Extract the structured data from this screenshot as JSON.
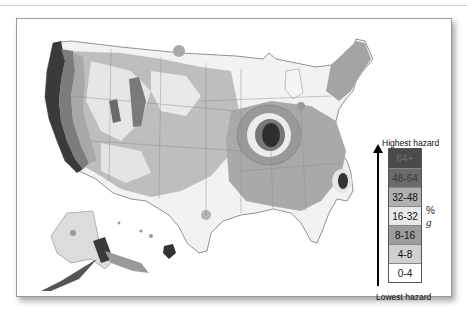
{
  "map": {
    "title": "Seismic hazard map of the United States",
    "regions_shown": [
      "Contiguous United States",
      "Alaska",
      "Hawaii"
    ]
  },
  "legend": {
    "top_label": "Highest hazard",
    "bottom_label": "Lowest hazard",
    "unit_prefix": "%",
    "unit_symbol": "g",
    "bins": [
      {
        "label": "64+",
        "color": "#4a4a4a",
        "text_color": "#6a6a6a"
      },
      {
        "label": "48-64",
        "color": "#6b6b6b",
        "text_color": "#3a3a3a"
      },
      {
        "label": "32-48",
        "color": "#b0b0b0",
        "text_color": "#111111"
      },
      {
        "label": "16-32",
        "color": "#e8e8e8",
        "text_color": "#111111"
      },
      {
        "label": "8-16",
        "color": "#9c9c9c",
        "text_color": "#111111"
      },
      {
        "label": "4-8",
        "color": "#cfcfcf",
        "text_color": "#111111"
      },
      {
        "label": "0-4",
        "color": "#ffffff",
        "text_color": "#111111"
      }
    ]
  },
  "colors": {
    "frame_border": "#9a9a9a",
    "state_lines": "#8a8a8a"
  }
}
